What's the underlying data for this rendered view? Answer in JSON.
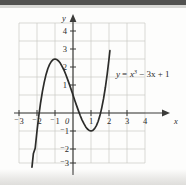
{
  "figure": {
    "equation_label": "y = x³ − 3x + 1",
    "equation_parts": {
      "lhs": "y",
      "equals": "=",
      "base": "x",
      "exponent": "3",
      "rest": "− 3x + 1"
    },
    "x_axis_name": "x",
    "y_axis_name": "y",
    "origin_label": "0"
  },
  "chart_data": {
    "type": "line",
    "title": "",
    "subtitle": "",
    "xlabel": "x",
    "ylabel": "y",
    "equation": "y = x^3 - 3x + 1",
    "grid": true,
    "legend": false,
    "annotations": [
      {
        "text": "y = x³ − 3x + 1",
        "x": 2.1,
        "y": 1.9
      }
    ],
    "xlim": [
      -3.2,
      4.3
    ],
    "ylim": [
      -3.2,
      4.3
    ],
    "x_ticks": [
      -3,
      -2,
      -1,
      1,
      2,
      3,
      4
    ],
    "y_ticks": [
      -3,
      -2,
      -1,
      1,
      2,
      3,
      4
    ],
    "x_tick_labels": [
      "⁻3",
      "⁻2",
      "⁻1",
      "1",
      "2",
      "3",
      "4"
    ],
    "y_tick_labels": [
      "⁻3",
      "⁻2",
      "⁻1",
      "1",
      "2",
      "3",
      "4"
    ],
    "grid_x_range": [
      -3.2,
      4.3
    ],
    "grid_y_range": [
      -3.2,
      4.3
    ],
    "features": {
      "local_maximum": [
        -1,
        3
      ],
      "local_minimum": [
        1,
        -1
      ],
      "y_intercept": 1,
      "x_intercepts": [
        -1.879,
        0.347,
        1.532
      ]
    },
    "series": [
      {
        "name": "y = x^3 - 3x + 1",
        "color": "#2c2c2a",
        "x": [
          -2.28,
          -2.2,
          -2.1,
          -2.0,
          -1.9,
          -1.8,
          -1.7,
          -1.6,
          -1.5,
          -1.4,
          -1.3,
          -1.2,
          -1.1,
          -1.0,
          -0.9,
          -0.8,
          -0.7,
          -0.6,
          -0.5,
          -0.4,
          -0.3,
          -0.2,
          -0.1,
          0.0,
          0.1,
          0.2,
          0.3,
          0.4,
          0.5,
          0.6,
          0.7,
          0.8,
          0.9,
          1.0,
          1.1,
          1.2,
          1.3,
          1.4,
          1.5,
          1.6,
          1.7,
          1.8,
          1.9,
          2.0,
          2.05
        ],
        "y": [
          -3.01,
          -2.25,
          -1.96,
          -1.0,
          -0.16,
          0.57,
          1.19,
          1.7,
          2.13,
          2.46,
          2.7,
          2.87,
          2.97,
          3.0,
          2.97,
          2.89,
          2.76,
          2.58,
          2.38,
          2.14,
          1.87,
          1.59,
          1.3,
          1.0,
          0.7,
          0.41,
          0.13,
          -0.14,
          -0.38,
          -0.58,
          -0.76,
          -0.89,
          -0.97,
          -1.0,
          -0.97,
          -0.87,
          -0.7,
          -0.46,
          -0.13,
          0.3,
          0.81,
          1.43,
          2.16,
          3.0,
          3.46
        ]
      }
    ]
  }
}
